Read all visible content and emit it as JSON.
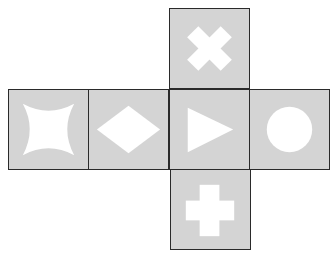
{
  "diagram": {
    "type": "cube-net",
    "face_color": "#d4d4d4",
    "symbol_color": "#ffffff",
    "border_color": "#2a2a2a",
    "faces": [
      {
        "position": "top",
        "symbol": "x-cross"
      },
      {
        "position": "left",
        "symbol": "four-point-star"
      },
      {
        "position": "center-left",
        "symbol": "diamond"
      },
      {
        "position": "center",
        "symbol": "right-triangle-arrow"
      },
      {
        "position": "right",
        "symbol": "circle"
      },
      {
        "position": "bottom",
        "symbol": "plus-cross"
      }
    ]
  }
}
